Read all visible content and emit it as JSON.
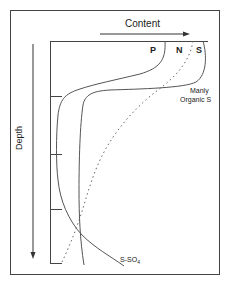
{
  "diagram": {
    "x_axis_label": "Content",
    "y_axis_label": "Depth",
    "curve_labels": {
      "p": "P",
      "n": "N",
      "s": "S"
    },
    "annotation_organic_line1": "Manly",
    "annotation_organic_line2": "Organic S",
    "annotation_sulfate": "S-SO",
    "annotation_sulfate_subscript": "4",
    "curves": [
      {
        "name": "P",
        "style": "solid"
      },
      {
        "name": "N",
        "style": "dotted"
      },
      {
        "name": "S",
        "style": "solid"
      }
    ],
    "colors": {
      "line": "#555555",
      "frame": "#444444",
      "text": "#222222"
    }
  }
}
